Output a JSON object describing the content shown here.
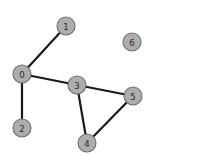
{
  "diagram": {
    "type": "node-link-graph",
    "title": "",
    "background_color": "#ffffff",
    "node_fill_color": "#adadad",
    "node_stroke_color": "#6e6e6e",
    "edge_color": "#1a1a1a",
    "label_color": "#2b2b2b",
    "node_radius": 9,
    "nodes": [
      {
        "id": "0",
        "label": "0",
        "x": 22,
        "y": 74
      },
      {
        "id": "1",
        "label": "1",
        "x": 66,
        "y": 26
      },
      {
        "id": "2",
        "label": "2",
        "x": 22,
        "y": 128
      },
      {
        "id": "3",
        "label": "3",
        "x": 77,
        "y": 85
      },
      {
        "id": "4",
        "label": "4",
        "x": 87,
        "y": 143
      },
      {
        "id": "5",
        "label": "5",
        "x": 133,
        "y": 96
      },
      {
        "id": "6",
        "label": "6",
        "x": 132,
        "y": 42
      }
    ],
    "edges": [
      {
        "source": "0",
        "target": "1"
      },
      {
        "source": "0",
        "target": "2"
      },
      {
        "source": "0",
        "target": "3"
      },
      {
        "source": "3",
        "target": "4"
      },
      {
        "source": "3",
        "target": "5"
      },
      {
        "source": "4",
        "target": "5"
      }
    ],
    "isolated_nodes": [
      "6"
    ]
  }
}
